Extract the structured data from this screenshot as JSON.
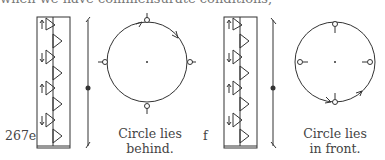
{
  "top_text": "when we have commensurate conditions,",
  "figures": [
    {
      "id": "267e",
      "caption_line1": "Circle lies",
      "caption_line2": "behind."
    },
    {
      "id": "f",
      "caption_line1": "Circle lies",
      "caption_line2": "in front."
    }
  ]
}
